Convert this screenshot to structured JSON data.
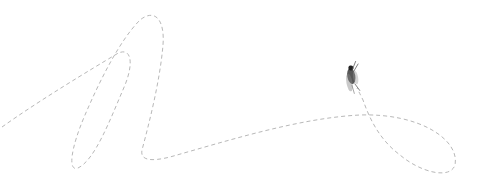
{
  "illustration": {
    "subject": "fly",
    "path_color": "#b8b8b8",
    "fly_color": "#2a2a2a",
    "background": "#ffffff"
  }
}
